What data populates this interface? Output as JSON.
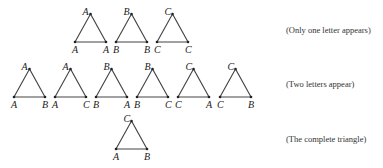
{
  "captions": {
    "row1": "(Only one letter appears)",
    "row2": "(Two letters appear)",
    "row3": "(The complete triangle)"
  },
  "rows": [
    {
      "name": "one-letter",
      "triangles": [
        {
          "apex": "A",
          "left": "A",
          "right": "A",
          "x": 75,
          "y": 14
        },
        {
          "apex": "B",
          "left": "B",
          "right": "B",
          "x": 116,
          "y": 14
        },
        {
          "apex": "C",
          "left": "C",
          "right": "C",
          "x": 157,
          "y": 14
        }
      ]
    },
    {
      "name": "two-letters",
      "triangles": [
        {
          "apex": "A",
          "left": "A",
          "right": "B",
          "x": 14,
          "y": 69
        },
        {
          "apex": "A",
          "left": "A",
          "right": "C",
          "x": 55,
          "y": 69
        },
        {
          "apex": "B",
          "left": "B",
          "right": "A",
          "x": 96,
          "y": 69
        },
        {
          "apex": "B",
          "left": "B",
          "right": "C",
          "x": 137,
          "y": 69
        },
        {
          "apex": "C",
          "left": "C",
          "right": "A",
          "x": 178,
          "y": 69
        },
        {
          "apex": "C",
          "left": "C",
          "right": "B",
          "x": 220,
          "y": 69
        }
      ]
    },
    {
      "name": "complete",
      "triangles": [
        {
          "apex": "C",
          "left": "A",
          "right": "B",
          "x": 116,
          "y": 121
        }
      ]
    }
  ]
}
